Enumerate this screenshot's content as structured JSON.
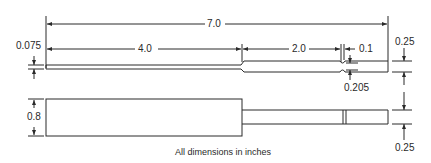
{
  "drawing": {
    "title": "Dimensioned part drawing (top and side views)",
    "units_note": "All dimensions in inches",
    "line_color": "#2a2a2a",
    "background": "#ffffff",
    "dimensions": {
      "overall_length": "7.0",
      "thin_section_length": "4.0",
      "shank_length": "2.0",
      "notch_offset": "0.1",
      "thin_section_thickness": "0.075",
      "shank_thickness": "0.205",
      "body_height": "0.8",
      "top_offset": "0.25",
      "bottom_offset": "0.25"
    },
    "views": [
      {
        "name": "top-view",
        "features": [
          "thin rod 4.0 long x 0.075 thick",
          "shank 2.0+ long x 0.205 thick",
          "notches near end"
        ]
      },
      {
        "name": "side-view",
        "features": [
          "body 4.0 long x 0.8 high",
          "shank with slot",
          "0.25 offsets top and bottom"
        ]
      }
    ]
  }
}
